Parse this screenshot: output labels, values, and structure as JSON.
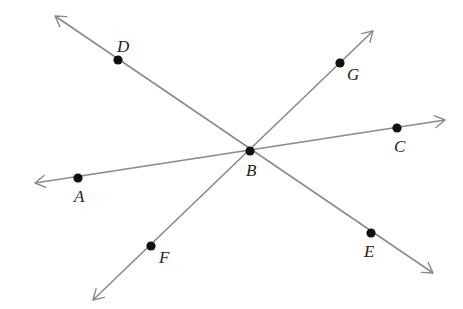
{
  "diagram": {
    "type": "geometry-lines-through-point",
    "colors": {
      "line": "#8a8a8a",
      "point": "#111111",
      "label": "#222222",
      "background": "#ffffff"
    },
    "intersection": "B",
    "lines": [
      {
        "id": "AC",
        "name": "line AC",
        "through": [
          "A",
          "B",
          "C"
        ],
        "from": [
          35,
          183
        ],
        "to": [
          445,
          120
        ]
      },
      {
        "id": "DE",
        "name": "line DE",
        "through": [
          "D",
          "B",
          "E"
        ],
        "from": [
          55,
          16
        ],
        "to": [
          433,
          273
        ]
      },
      {
        "id": "FG",
        "name": "line FG",
        "through": [
          "F",
          "B",
          "G"
        ],
        "from": [
          93,
          300
        ],
        "to": [
          373,
          31
        ]
      }
    ],
    "points": [
      {
        "label": "A",
        "x": 78,
        "y": 178,
        "lx": 74,
        "ly": 202
      },
      {
        "label": "B",
        "x": 250,
        "y": 151,
        "lx": 246,
        "ly": 176
      },
      {
        "label": "C",
        "x": 397,
        "y": 128,
        "lx": 394,
        "ly": 152
      },
      {
        "label": "D",
        "x": 118,
        "y": 60,
        "lx": 117,
        "ly": 52
      },
      {
        "label": "E",
        "x": 371,
        "y": 233,
        "lx": 364,
        "ly": 257
      },
      {
        "label": "F",
        "x": 151,
        "y": 246,
        "lx": 159,
        "ly": 263
      },
      {
        "label": "G",
        "x": 340,
        "y": 63,
        "lx": 347,
        "ly": 80
      }
    ]
  }
}
